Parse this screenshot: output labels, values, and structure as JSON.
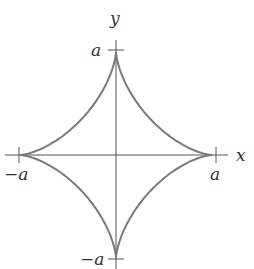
{
  "diagram": {
    "equation": "x^(2/3) + y^(2/3) = a^(2/3)",
    "axes": {
      "x_label": "x",
      "y_label": "y"
    },
    "ticks": {
      "x_positive": "a",
      "x_negative": "−a",
      "y_positive": "a",
      "y_negative": "−a"
    },
    "colors": {
      "curve": "#7a7a7a",
      "axes": "#555555",
      "text": "#333333"
    }
  }
}
